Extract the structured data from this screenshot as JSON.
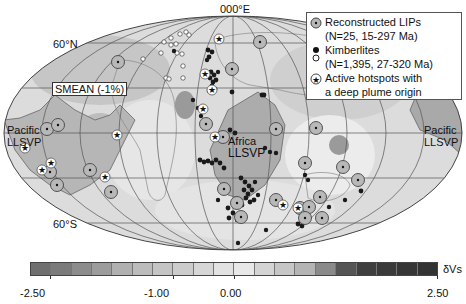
{
  "map": {
    "projection": "Mollweide",
    "central_meridian_label": "000°E",
    "lat_labels": {
      "north": "60°N",
      "south": "60°S"
    },
    "region_labels": {
      "pacific_left": [
        "Pacific",
        "LLSVP"
      ],
      "pacific_right": [
        "Pacific",
        "LLSVP"
      ],
      "africa": [
        "Africa",
        "LLSVP"
      ]
    },
    "model_label": "SMEAN (-1%)"
  },
  "legend": {
    "lips": {
      "label": "Reconstructed LIPs",
      "detail": "(N=25,  15-297 Ma)"
    },
    "kimberlites": {
      "label": "Kimberlites",
      "detail": "(N=1,395, 27-320 Ma)"
    },
    "hotspots": {
      "label": "Active hotspots with",
      "detail": "a deep plume origin"
    }
  },
  "colorbar": {
    "label": "δVs",
    "ticks": [
      "-2.50",
      "-1.00",
      "0.00",
      "2.50"
    ],
    "segment_colors": [
      "#6f6f6f",
      "#7b7b7b",
      "#8c8c8c",
      "#9c9c9c",
      "#b0b0b0",
      "#bcbcbc",
      "#c4c4c4",
      "#cccccc",
      "#d6d6d6",
      "#e2e2e2",
      "#e8e8e8",
      "#d4d4d4",
      "#c6c6c6",
      "#b4b4b4",
      "#8a8a8a",
      "#555555",
      "#3f3f3f",
      "#3a3a3a",
      "#363636",
      "#333333"
    ]
  },
  "colors": {
    "background": "#ffffff",
    "map_base": "#d9d9d9",
    "llsvp_fill": "#a8a8a8",
    "grid": "#555555",
    "lip_fill": "#b5b5b5",
    "kimberlite_dark": "#1a1a1a",
    "kimberlite_white": "#ffffff"
  }
}
